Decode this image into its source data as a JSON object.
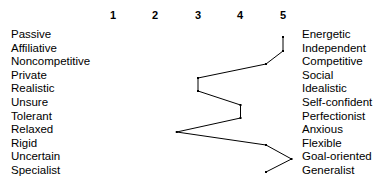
{
  "chart_data": {
    "type": "line",
    "title": "",
    "subtitle": "",
    "xlabel": "",
    "ylabel": "",
    "orientation": "horizontal-profile",
    "grid": false,
    "legend": null,
    "xlim": [
      1,
      5
    ],
    "xticks": [
      1,
      2,
      3,
      4,
      5
    ],
    "xtick_labels": [
      "1",
      "2",
      "3",
      "4",
      "5"
    ],
    "categories": [
      "Passive — Energetic",
      "Affiliative — Independent",
      "Noncompetitive — Competitive",
      "Private — Social",
      "Realistic — Idealistic",
      "Unsure — Self-confident",
      "Tolerant — Perfectionist",
      "Relaxed — Anxious",
      "Rigid — Flexible",
      "Uncertain — Goal-oriented",
      "Specialist — Generalist"
    ],
    "left_labels": [
      "Passive",
      "Affiliative",
      "Noncompetitive",
      "Private",
      "Realistic",
      "Unsure",
      "Tolerant",
      "Relaxed",
      "Rigid",
      "Uncertain",
      "Specialist"
    ],
    "right_labels": [
      "Energetic",
      "Independent",
      "Competitive",
      "Social",
      "Idealistic",
      "Self-confident",
      "Perfectionist",
      "Anxious",
      "Flexible",
      "Goal-oriented",
      "Generalist"
    ],
    "values": [
      5.0,
      5.0,
      4.6,
      3.0,
      3.0,
      4.0,
      4.0,
      2.5,
      4.6,
      5.2,
      4.6
    ],
    "series": [
      {
        "name": "Profile",
        "values": [
          5.0,
          5.0,
          4.6,
          3.0,
          3.0,
          4.0,
          4.0,
          2.5,
          4.6,
          5.2,
          4.6
        ]
      }
    ],
    "line_color": "#000000",
    "marker": "dot",
    "background_color": "#ffffff"
  },
  "geometry": {
    "tick_x_px": [
      113,
      155.5,
      198,
      240.5,
      283
    ],
    "row_y_px": [
      37,
      51,
      64,
      78,
      91,
      105,
      118,
      132,
      145,
      159,
      172
    ],
    "point_x_px": [
      283,
      283,
      265,
      197,
      197,
      240,
      240,
      175,
      265,
      290,
      265
    ]
  }
}
